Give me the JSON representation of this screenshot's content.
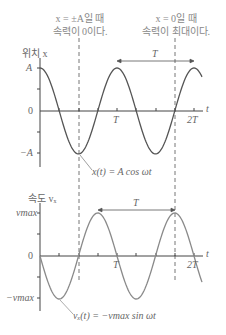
{
  "annotations": {
    "left_note_line1": "x = ±A일 때",
    "left_note_line2": "속력이 0이다.",
    "right_note_line1": "x = 0일 때",
    "right_note_line2": "속력이 최대이다."
  },
  "position_graph": {
    "ylabel": "위치 x",
    "y_top": "A",
    "y_zero": "0",
    "y_bottom": "−A",
    "xlabel": "t",
    "x_ticks": [
      "T",
      "2T"
    ],
    "period_label": "T",
    "equation": "x(t) = A cos ωt",
    "curve_color": "#555555"
  },
  "velocity_graph": {
    "ylabel": "속도 vₓ",
    "y_top": "vmax",
    "y_zero": "0",
    "y_bottom": "−vmax",
    "xlabel": "t",
    "x_ticks": [
      "T",
      "2T"
    ],
    "period_label": "T",
    "equation": "vₓ(t) = −vmax sin ωt",
    "curve_color": "#8a8a8a"
  },
  "chart_data": [
    {
      "type": "line",
      "title": "위치 x",
      "xlabel": "t",
      "ylabel": "위치 x",
      "x_ticks": [
        "0",
        "T",
        "2T"
      ],
      "y_ticks": [
        "−A",
        "0",
        "A"
      ],
      "function": "x(t) = A cos ωt",
      "x": [
        0,
        0.25,
        0.5,
        0.75,
        1.0,
        1.25,
        1.5,
        1.75,
        2.0
      ],
      "values": [
        1,
        0,
        -1,
        0,
        1,
        0,
        -1,
        0,
        1
      ],
      "ylim": [
        -1,
        1
      ]
    },
    {
      "type": "line",
      "title": "속도 vₓ",
      "xlabel": "t",
      "ylabel": "속도 vₓ",
      "x_ticks": [
        "0",
        "T",
        "2T"
      ],
      "y_ticks": [
        "−vmax",
        "0",
        "vmax"
      ],
      "function": "vₓ(t) = −vmax sin ωt",
      "x": [
        0,
        0.25,
        0.5,
        0.75,
        1.0,
        1.25,
        1.5,
        1.75,
        2.0
      ],
      "values": [
        0,
        -1,
        0,
        1,
        0,
        -1,
        0,
        1,
        0
      ],
      "ylim": [
        -1,
        1
      ]
    }
  ]
}
